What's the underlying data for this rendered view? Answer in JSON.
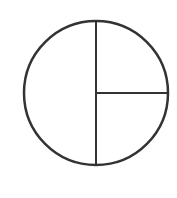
{
  "diagram": {
    "type": "fraction-circle",
    "stroke_color": "#333333",
    "fill_color": "#ffffff",
    "background": "#ffffff",
    "circle": {
      "cx": 96,
      "cy": 93,
      "r": 72,
      "stroke_width": 2.5
    },
    "segments": [
      {
        "name": "left-half",
        "fraction": "1/2"
      },
      {
        "name": "upper-right-quarter",
        "fraction": "1/4"
      },
      {
        "name": "lower-right-quarter",
        "fraction": "1/4"
      }
    ],
    "lines": [
      {
        "name": "vertical-divider",
        "x1": 96,
        "y1": 21,
        "x2": 96,
        "y2": 165
      },
      {
        "name": "horizontal-divider",
        "x1": 96,
        "y1": 93,
        "x2": 168,
        "y2": 93
      }
    ]
  }
}
